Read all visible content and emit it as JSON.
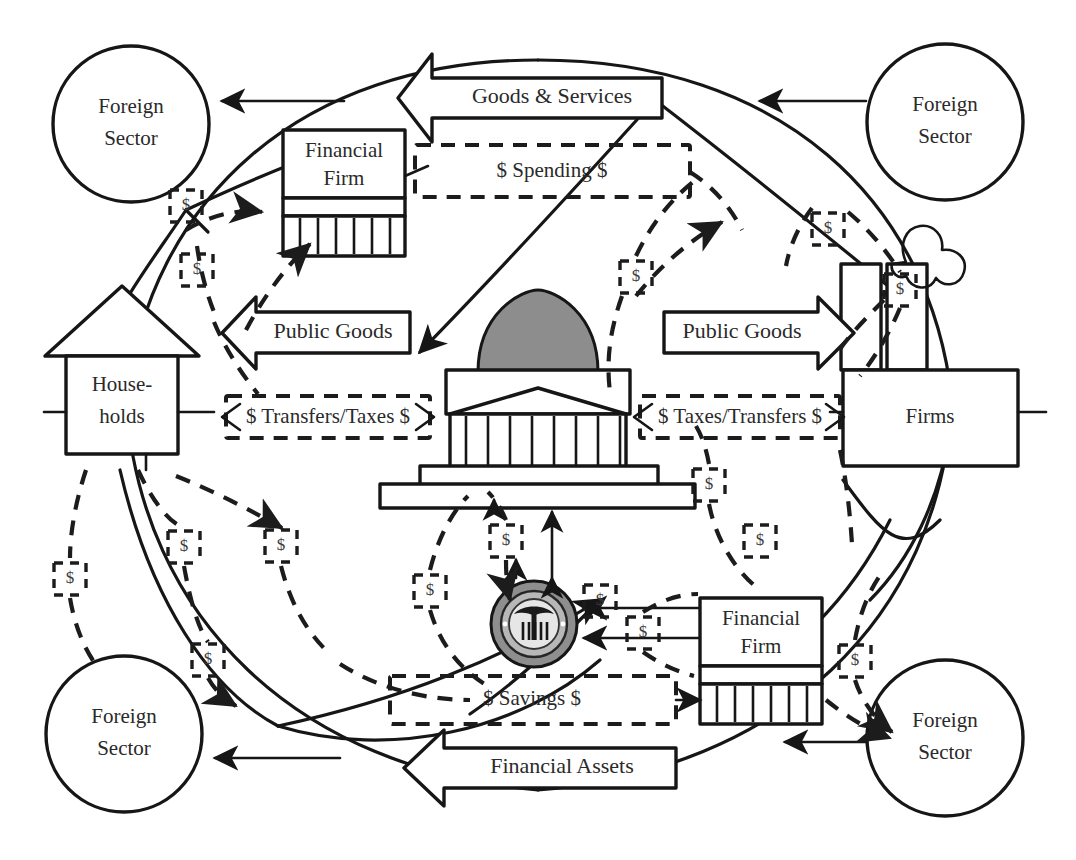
{
  "diagram": {
    "type": "circular-flow",
    "background_color": "#ffffff",
    "line_color": "#161616",
    "dome_color": "#8d8d8d"
  },
  "nodes": {
    "households": {
      "label_line1": "House-",
      "label_line2": "holds",
      "icon": "house-icon"
    },
    "firms": {
      "label": "Firms",
      "icon": "factory-icon"
    },
    "government": {
      "label": "",
      "icon": "capitol-building-icon"
    },
    "central_bank": {
      "label": "",
      "icon": "federal-reserve-seal-icon"
    },
    "financial_firm_top": {
      "label_line1": "Financial",
      "label_line2": "Firm",
      "icon": "bank-icon"
    },
    "financial_firm_bottom": {
      "label_line1": "Financial",
      "label_line2": "Firm",
      "icon": "bank-icon"
    },
    "foreign_sectors": [
      {
        "id": "foreign-top-left",
        "label_line1": "Foreign",
        "label_line2": "Sector"
      },
      {
        "id": "foreign-top-right",
        "label_line1": "Foreign",
        "label_line2": "Sector"
      },
      {
        "id": "foreign-bottom-left",
        "label_line1": "Foreign",
        "label_line2": "Sector"
      },
      {
        "id": "foreign-bottom-right",
        "label_line1": "Foreign",
        "label_line2": "Sector"
      }
    ]
  },
  "banners": {
    "goods_services": {
      "label": "Goods & Services",
      "direction": "left",
      "style": "solid-block-arrow"
    },
    "financial_assets": {
      "label": "Financial Assets",
      "direction": "left",
      "style": "solid-block-arrow"
    },
    "public_goods_left": {
      "label": "Public Goods",
      "direction": "left",
      "style": "solid-block-arrow"
    },
    "public_goods_right": {
      "label": "Public Goods",
      "direction": "right",
      "style": "solid-block-arrow"
    }
  },
  "money_flows": {
    "spending": {
      "label": "$ Spending $",
      "style": "dashed"
    },
    "savings": {
      "label": "$ Savings $",
      "style": "dashed"
    },
    "transfers_taxes_left": {
      "label": "$ Transfers/Taxes $",
      "style": "dashed",
      "direction": "both"
    },
    "taxes_transfers_right": {
      "label": "$ Taxes/Transfers $",
      "style": "dashed",
      "direction": "both"
    }
  },
  "dollar_markers": {
    "symbol": "$",
    "count": 16,
    "positions": [
      {
        "id": "dollar-marker-1",
        "x": 186,
        "y": 205
      },
      {
        "id": "dollar-marker-2",
        "x": 197,
        "y": 269
      },
      {
        "id": "dollar-marker-3",
        "x": 636,
        "y": 276
      },
      {
        "id": "dollar-marker-4",
        "x": 828,
        "y": 228
      },
      {
        "id": "dollar-marker-5",
        "x": 900,
        "y": 289
      },
      {
        "id": "dollar-marker-6",
        "x": 709,
        "y": 484
      },
      {
        "id": "dollar-marker-7",
        "x": 70,
        "y": 578
      },
      {
        "id": "dollar-marker-8",
        "x": 184,
        "y": 546
      },
      {
        "id": "dollar-marker-9",
        "x": 281,
        "y": 545
      },
      {
        "id": "dollar-marker-10",
        "x": 430,
        "y": 590
      },
      {
        "id": "dollar-marker-11",
        "x": 208,
        "y": 659
      },
      {
        "id": "dollar-marker-12",
        "x": 506,
        "y": 540
      },
      {
        "id": "dollar-marker-13",
        "x": 643,
        "y": 632
      },
      {
        "id": "dollar-marker-14",
        "x": 855,
        "y": 660
      },
      {
        "id": "dollar-marker-15",
        "x": 600,
        "y": 600
      },
      {
        "id": "dollar-marker-16",
        "x": 760,
        "y": 540
      }
    ]
  }
}
